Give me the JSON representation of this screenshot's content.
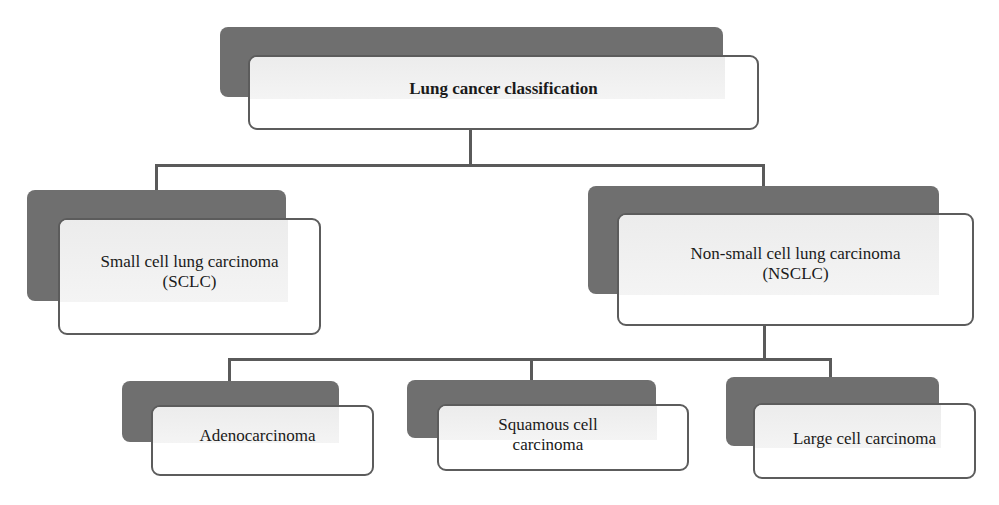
{
  "diagram": {
    "title": "Lung cancer classification",
    "colors": {
      "shadow": "#6f6f6f",
      "border": "#5c5c5c",
      "connector": "#5a5a5a",
      "box_fill": "#ffffff",
      "text": "#1a1a1a"
    },
    "nodes": {
      "root": {
        "label": "Lung cancer classification"
      },
      "sclc": {
        "line1": "Small cell lung carcinoma",
        "line2": "(SCLC)"
      },
      "nsclc": {
        "line1": "Non-small cell lung carcinoma",
        "line2": "(NSCLC)"
      },
      "adeno": {
        "label": "Adenocarcinoma"
      },
      "squamous": {
        "line1": "Squamous cell",
        "line2": "carcinoma"
      },
      "large": {
        "label": "Large cell carcinoma"
      }
    },
    "edges": [
      {
        "from": "root",
        "to": "sclc"
      },
      {
        "from": "root",
        "to": "nsclc"
      },
      {
        "from": "nsclc",
        "to": "adeno"
      },
      {
        "from": "nsclc",
        "to": "squamous"
      },
      {
        "from": "nsclc",
        "to": "large"
      }
    ]
  }
}
